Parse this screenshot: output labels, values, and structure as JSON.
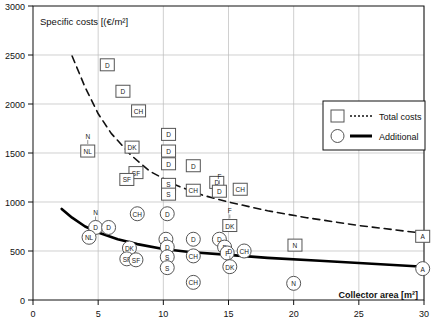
{
  "chart_data": {
    "type": "scatter",
    "title": "Specific costs [(€/m²]",
    "xlabel": "Collector area [m²]",
    "ylabel": "Specific costs [(€/m²]",
    "xlim": [
      0,
      30
    ],
    "ylim": [
      0,
      3000
    ],
    "xticks": [
      "0",
      "5",
      "10",
      "15",
      "20",
      "25",
      "30"
    ],
    "yticks": [
      "0",
      "500",
      "1000",
      "1500",
      "2000",
      "2500",
      "3000"
    ],
    "grid": true,
    "legend": {
      "position": "upper-right",
      "entries": [
        {
          "label": "Total costs",
          "marker": "square",
          "line": "dotted"
        },
        {
          "label": "Additional",
          "marker": "circle",
          "line": "solid"
        }
      ]
    },
    "series": [
      {
        "name": "Total costs",
        "marker": "square",
        "points": [
          {
            "x": 5.7,
            "y": 2400,
            "label": "D"
          },
          {
            "x": 6.9,
            "y": 2130,
            "label": "D"
          },
          {
            "x": 8.1,
            "y": 1930,
            "label": "CH"
          },
          {
            "x": 10.4,
            "y": 1690,
            "label": "D"
          },
          {
            "x": 4.2,
            "y": 1520,
            "label": "NL",
            "callout": "N"
          },
          {
            "x": 7.6,
            "y": 1560,
            "label": "DK"
          },
          {
            "x": 10.4,
            "y": 1520,
            "label": "D"
          },
          {
            "x": 10.4,
            "y": 1390,
            "label": "D"
          },
          {
            "x": 12.3,
            "y": 1370,
            "label": "D"
          },
          {
            "x": 7.9,
            "y": 1300,
            "label": "SF"
          },
          {
            "x": 7.2,
            "y": 1230,
            "label": "SF"
          },
          {
            "x": 10.4,
            "y": 1180,
            "label": "S"
          },
          {
            "x": 14.1,
            "y": 1200,
            "label": "D"
          },
          {
            "x": 12.3,
            "y": 1120,
            "label": "CH"
          },
          {
            "x": 10.4,
            "y": 1080,
            "label": "S"
          },
          {
            "x": 14.3,
            "y": 1110,
            "label": "D",
            "callout": "F"
          },
          {
            "x": 15.9,
            "y": 1130,
            "label": "CH"
          },
          {
            "x": 15.1,
            "y": 760,
            "label": "DK",
            "callout": "F"
          },
          {
            "x": 20.1,
            "y": 560,
            "label": "N"
          },
          {
            "x": 29.9,
            "y": 650,
            "label": "A"
          }
        ]
      },
      {
        "name": "Additional",
        "marker": "circle",
        "points": [
          {
            "x": 8.0,
            "y": 880,
            "label": "CH"
          },
          {
            "x": 10.3,
            "y": 880,
            "label": "D"
          },
          {
            "x": 4.8,
            "y": 740,
            "label": "D",
            "callout": "N"
          },
          {
            "x": 5.8,
            "y": 740,
            "label": "D"
          },
          {
            "x": 4.3,
            "y": 640,
            "label": "NL"
          },
          {
            "x": 10.2,
            "y": 620,
            "label": "D"
          },
          {
            "x": 12.3,
            "y": 620,
            "label": "D"
          },
          {
            "x": 14.3,
            "y": 620,
            "label": "D"
          },
          {
            "x": 7.4,
            "y": 530,
            "label": "DK"
          },
          {
            "x": 10.3,
            "y": 540,
            "label": "D"
          },
          {
            "x": 14.7,
            "y": 540,
            "label": "F"
          },
          {
            "x": 10.3,
            "y": 440,
            "label": "S"
          },
          {
            "x": 12.3,
            "y": 450,
            "label": "CH"
          },
          {
            "x": 14.9,
            "y": 480,
            "label": "F"
          },
          {
            "x": 16.2,
            "y": 500,
            "label": "CH"
          },
          {
            "x": 7.2,
            "y": 420,
            "label": "SF"
          },
          {
            "x": 7.9,
            "y": 410,
            "label": "SF"
          },
          {
            "x": 10.3,
            "y": 330,
            "label": "S"
          },
          {
            "x": 12.3,
            "y": 180,
            "label": "CH"
          },
          {
            "x": 15.1,
            "y": 340,
            "label": "DK",
            "callout": "D"
          },
          {
            "x": 20.0,
            "y": 170,
            "label": "N"
          },
          {
            "x": 29.9,
            "y": 320,
            "label": "A"
          }
        ]
      }
    ],
    "trend_lines": [
      {
        "name": "Total costs",
        "style": "dashed",
        "points": [
          {
            "x": 3.0,
            "y": 2490
          },
          {
            "x": 4.0,
            "y": 2170
          },
          {
            "x": 5.0,
            "y": 1900
          },
          {
            "x": 6.0,
            "y": 1700
          },
          {
            "x": 7.5,
            "y": 1480
          },
          {
            "x": 9.0,
            "y": 1310
          },
          {
            "x": 11.0,
            "y": 1170
          },
          {
            "x": 13.0,
            "y": 1070
          },
          {
            "x": 15.0,
            "y": 1000
          },
          {
            "x": 18.0,
            "y": 910
          },
          {
            "x": 21.0,
            "y": 840
          },
          {
            "x": 25.0,
            "y": 760
          },
          {
            "x": 30.0,
            "y": 680
          }
        ]
      },
      {
        "name": "Additional",
        "style": "solid",
        "points": [
          {
            "x": 2.2,
            "y": 930
          },
          {
            "x": 3.0,
            "y": 840
          },
          {
            "x": 4.0,
            "y": 750
          },
          {
            "x": 5.0,
            "y": 690
          },
          {
            "x": 6.5,
            "y": 620
          },
          {
            "x": 8.0,
            "y": 570
          },
          {
            "x": 10.0,
            "y": 520
          },
          {
            "x": 12.0,
            "y": 490
          },
          {
            "x": 15.0,
            "y": 460
          },
          {
            "x": 18.0,
            "y": 430
          },
          {
            "x": 22.0,
            "y": 400
          },
          {
            "x": 26.0,
            "y": 370
          },
          {
            "x": 30.0,
            "y": 340
          }
        ]
      }
    ]
  },
  "colors": {
    "axis": "#111111",
    "grid": "#bbbbbb",
    "marker_stroke": "#555555",
    "trend_dashed": "#111111",
    "trend_solid": "#000000",
    "background": "#ffffff"
  }
}
